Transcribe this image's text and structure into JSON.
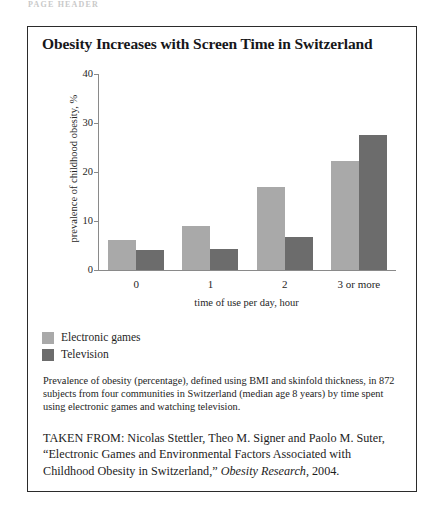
{
  "page": {
    "running_head": "PAGE HEADER"
  },
  "figure": {
    "title": "Obesity Increases with Screen Time in Switzerland",
    "caption": "Prevalence of obesity (percentage), defined using BMI and skinfold thickness, in 872 subjects from four communities in Switzerland (median age 8 years) by time spent using electronic games and watching television.",
    "source": {
      "prefix": "TAKEN FROM: Nicolas Stettler, Theo M. Signer and Paolo M. Suter, “Electronic Games and Environmental Factors Associated with Childhood Obesity in Switzerland,” ",
      "journal": "Obesity Research",
      "suffix": ", 2004."
    }
  },
  "chart_data": {
    "type": "bar",
    "title": "Obesity Increases with Screen Time in Switzerland",
    "xlabel": "time of use per day, hour",
    "ylabel": "prevalence of childhood obesity, %",
    "categories": [
      "0",
      "1",
      "2",
      "3 or more"
    ],
    "series": [
      {
        "name": "Electronic games",
        "color": "#a9a9a9",
        "values": [
          6.2,
          9.0,
          17.0,
          22.3
        ]
      },
      {
        "name": "Television",
        "color": "#6c6c6c",
        "values": [
          4.0,
          4.3,
          6.8,
          27.5
        ]
      }
    ],
    "ylim": [
      0,
      40
    ],
    "yticks": [
      0,
      10,
      20,
      30,
      40
    ],
    "grid": false,
    "legend_position": "below-plot-left"
  }
}
